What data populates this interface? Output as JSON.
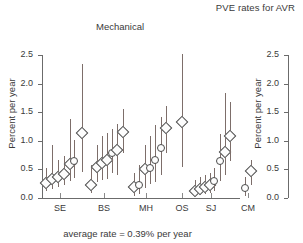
{
  "figure": {
    "title": "PVE rates for AVR",
    "footnote": "average rate = 0.39% per year"
  },
  "chart_data": {
    "type": "scatter",
    "title": "PVE rates for AVR",
    "subtitle": "Mechanical",
    "xlabel": "",
    "ylabel": "Percent per year",
    "ylim": [
      0.0,
      2.5
    ],
    "yticks": [
      "0.0",
      "0.5",
      "1.0",
      "1.5",
      "2.0",
      "2.5"
    ],
    "ytick_values": [
      0.0,
      0.5,
      1.0,
      1.5,
      2.0,
      2.5
    ],
    "grid": false,
    "legend": null,
    "annotations": [
      "average rate = 0.39% per year"
    ],
    "categories": [
      "SE",
      "BS",
      "MH",
      "OS",
      "SJ",
      "CM"
    ],
    "error_bars": "vertical confidence intervals",
    "note": "Each group contains several studies; marker = point estimate, vertical line = confidence interval. Marker shape: diamond or circle.",
    "groups": [
      {
        "label": "SE",
        "x_center": 18,
        "points": [
          {
            "x": 4,
            "value": 0.27,
            "low": 0.12,
            "high": 0.53,
            "marker": "diamond"
          },
          {
            "x": 10,
            "value": 0.33,
            "low": 0.16,
            "high": 0.93,
            "marker": "diamond"
          },
          {
            "x": 16,
            "value": 0.37,
            "low": 0.2,
            "high": 0.66,
            "marker": "diamond"
          },
          {
            "x": 22,
            "value": 0.42,
            "low": 0.22,
            "high": 0.73,
            "marker": "diamond"
          },
          {
            "x": 28,
            "value": 0.6,
            "low": 0.3,
            "high": 1.38,
            "marker": "diamond"
          },
          {
            "x": 32,
            "value": 0.64,
            "low": 0.35,
            "high": 1.02,
            "marker": "circle"
          },
          {
            "x": 40,
            "value": 1.14,
            "low": 0.46,
            "high": 2.34,
            "marker": "diamond"
          }
        ]
      },
      {
        "label": "BS",
        "x_center": 62,
        "points": [
          {
            "x": 49,
            "value": 0.23,
            "low": 0.08,
            "high": 0.57,
            "marker": "diamond"
          },
          {
            "x": 55,
            "value": 0.55,
            "low": 0.28,
            "high": 0.93,
            "marker": "diamond"
          },
          {
            "x": 60,
            "value": 0.62,
            "low": 0.32,
            "high": 1.08,
            "marker": "diamond"
          },
          {
            "x": 65,
            "value": 0.66,
            "low": 0.34,
            "high": 1.14,
            "marker": "diamond"
          },
          {
            "x": 70,
            "value": 0.78,
            "low": 0.44,
            "high": 1.2,
            "marker": "circle"
          },
          {
            "x": 75,
            "value": 0.84,
            "low": 0.4,
            "high": 1.3,
            "marker": "diamond"
          },
          {
            "x": 81,
            "value": 1.15,
            "low": 0.78,
            "high": 1.55,
            "marker": "diamond"
          }
        ]
      },
      {
        "label": "MH",
        "x_center": 104,
        "points": [
          {
            "x": 92,
            "value": 0.2,
            "low": 0.04,
            "high": 0.44,
            "marker": "diamond"
          },
          {
            "x": 97,
            "value": 0.23,
            "low": 0.07,
            "high": 0.58,
            "marker": "circle"
          },
          {
            "x": 103,
            "value": 0.51,
            "low": 0.18,
            "high": 0.92,
            "marker": "diamond"
          },
          {
            "x": 108,
            "value": 0.53,
            "low": 0.25,
            "high": 1.09,
            "marker": "circle"
          },
          {
            "x": 113,
            "value": 0.67,
            "low": 0.28,
            "high": 1.27,
            "marker": "circle"
          },
          {
            "x": 119,
            "value": 0.88,
            "low": 0.4,
            "high": 1.41,
            "marker": "circle"
          },
          {
            "x": 124,
            "value": 1.22,
            "low": 0.78,
            "high": 1.61,
            "marker": "diamond"
          }
        ]
      },
      {
        "label": "OS",
        "x_center": 140,
        "points": [
          {
            "x": 140,
            "value": 1.32,
            "low": 0.55,
            "high": 2.52,
            "marker": "diamond"
          }
        ]
      },
      {
        "label": "SJ",
        "x_center": 169,
        "points": [
          {
            "x": 153,
            "value": 0.13,
            "low": 0.04,
            "high": 0.32,
            "marker": "diamond"
          },
          {
            "x": 158,
            "value": 0.16,
            "low": 0.05,
            "high": 0.36,
            "marker": "diamond"
          },
          {
            "x": 163,
            "value": 0.19,
            "low": 0.07,
            "high": 0.4,
            "marker": "diamond"
          },
          {
            "x": 168,
            "value": 0.22,
            "low": 0.09,
            "high": 0.44,
            "marker": "diamond"
          },
          {
            "x": 172,
            "value": 0.3,
            "low": 0.12,
            "high": 0.52,
            "marker": "circle"
          },
          {
            "x": 178,
            "value": 0.64,
            "low": 0.3,
            "high": 1.12,
            "marker": "circle"
          },
          {
            "x": 183,
            "value": 0.81,
            "low": 0.4,
            "high": 1.83,
            "marker": "diamond"
          },
          {
            "x": 188,
            "value": 1.08,
            "low": 0.64,
            "high": 1.67,
            "marker": "diamond"
          }
        ]
      },
      {
        "label": "CM",
        "x_center": 206,
        "points": [
          {
            "x": 203,
            "value": 0.17,
            "low": 0.03,
            "high": 0.37,
            "marker": "circle"
          },
          {
            "x": 209,
            "value": 0.48,
            "low": 0.23,
            "high": 0.66,
            "marker": "diamond"
          }
        ]
      }
    ]
  },
  "panels": [
    {
      "id": "left",
      "title": "Mechanical",
      "ylabel": "Percent per year",
      "yticks": [
        "0.0",
        "0.5",
        "1.0",
        "1.5",
        "2.0",
        "2.5"
      ],
      "xlabels": [
        "SE",
        "BS",
        "MH",
        "OS",
        "SJ",
        "CM"
      ]
    },
    {
      "id": "right",
      "title": "",
      "ylabel": "Percent per year",
      "yticks": [
        "0.0",
        "0.5",
        "1.0",
        "1.5",
        "2.0",
        "2.5"
      ],
      "xlabels": []
    }
  ]
}
